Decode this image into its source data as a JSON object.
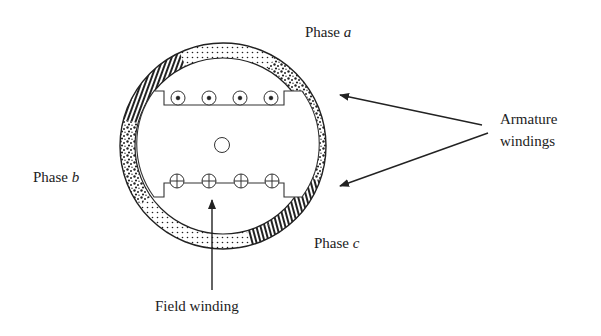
{
  "diagram": {
    "labels": {
      "phase_a_prefix": "Phase ",
      "phase_a_var": "a",
      "phase_b_prefix": "Phase ",
      "phase_b_var": "b",
      "phase_c_prefix": "Phase ",
      "phase_c_var": "c",
      "armature_line1": "Armature",
      "armature_line2": "windings",
      "field_winding": "Field winding"
    },
    "stator": {
      "center": [
        223,
        146
      ],
      "outer_radius": 103,
      "inner_radius": 88
    },
    "rotor": {
      "top_conductors": [
        "dot",
        "dot",
        "dot",
        "dot"
      ],
      "bottom_conductors": [
        "cross",
        "cross",
        "cross",
        "cross"
      ],
      "shaft": "circle"
    },
    "colors": {
      "ink": "#222222",
      "background": "#ffffff"
    }
  }
}
